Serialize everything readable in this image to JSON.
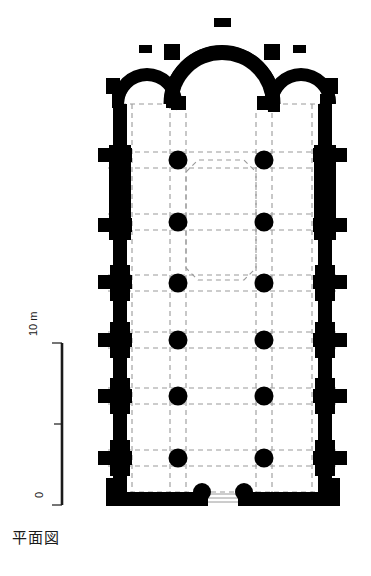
{
  "figure": {
    "caption": "平面図",
    "type": "architectural-floor-plan"
  },
  "scale": {
    "unit_label": "m",
    "top_value": "10",
    "bottom_value": "0",
    "combined_top_label": "10 m",
    "ticks": [
      "10",
      "5",
      "0"
    ]
  },
  "colors": {
    "wall": "#000000",
    "grid": "#9a9a9a",
    "background": "#ffffff",
    "text": "#1a1a1a"
  },
  "plan": {
    "body": {
      "left": 112,
      "right": 332,
      "top": 100,
      "bottom": 505
    },
    "apses": [
      {
        "name": "north-side-apse",
        "cx": 146,
        "cy": 100,
        "radius_outer": 36,
        "radius_inner": 23
      },
      {
        "name": "central-apse",
        "cx": 222,
        "cy": 100,
        "radius_outer": 58,
        "radius_inner": 40
      },
      {
        "name": "south-side-apse",
        "cx": 300,
        "cy": 100,
        "radius_outer": 36,
        "radius_inner": 23
      }
    ],
    "columns": {
      "count": 12,
      "x_positions": [
        178,
        264
      ],
      "y_positions": [
        160,
        222,
        283,
        340,
        396,
        458
      ],
      "radius": 9
    },
    "west_piers": {
      "x": 120,
      "y_positions": [
        105,
        160,
        222,
        283,
        340,
        396,
        458
      ]
    },
    "east_piers": {
      "x": 324,
      "y_positions": [
        105,
        160,
        222,
        283,
        340,
        396,
        458
      ]
    },
    "crossing": {
      "name": "domed-crossing-bay",
      "bounds": {
        "left": 178,
        "top": 160,
        "right": 264,
        "bottom": 283
      },
      "shape": "octagon"
    },
    "entrance": {
      "name": "west-doorway",
      "x_start": 205,
      "x_end": 239,
      "y": 499
    },
    "grid": {
      "vertical_x": [
        132,
        170,
        186,
        256,
        272,
        312
      ],
      "horizontal_y": [
        152,
        168,
        214,
        230,
        275,
        291,
        332,
        348,
        388,
        404,
        450,
        466,
        492
      ]
    }
  }
}
